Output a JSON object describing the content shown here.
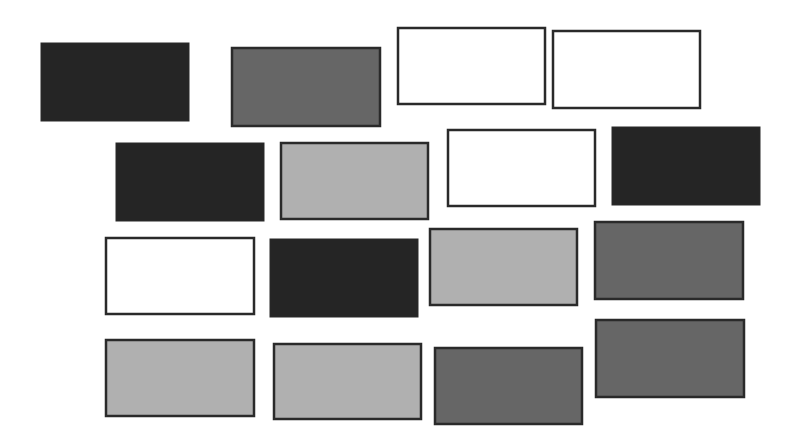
{
  "figure": {
    "shade_colors": {
      "black": "#252525",
      "dark_gray": "#666666",
      "light_gray": "#b0b0b0",
      "white": "#ffffff"
    },
    "border_color": "#2a2a2a",
    "rows": [
      [
        {
          "shade": "black",
          "x": 41,
          "y": 43,
          "w": 148,
          "h": 78
        },
        {
          "shade": "dark_gray",
          "x": 232,
          "y": 48,
          "w": 148,
          "h": 78
        },
        {
          "shade": "white",
          "x": 398,
          "y": 28,
          "w": 147,
          "h": 76
        },
        {
          "shade": "white",
          "x": 553,
          "y": 31,
          "w": 147,
          "h": 77
        }
      ],
      [
        {
          "shade": "black",
          "x": 116,
          "y": 143,
          "w": 148,
          "h": 78
        },
        {
          "shade": "light_gray",
          "x": 281,
          "y": 143,
          "w": 147,
          "h": 76
        },
        {
          "shade": "white",
          "x": 448,
          "y": 130,
          "w": 147,
          "h": 76
        },
        {
          "shade": "black",
          "x": 612,
          "y": 127,
          "w": 148,
          "h": 78
        }
      ],
      [
        {
          "shade": "white",
          "x": 106,
          "y": 238,
          "w": 148,
          "h": 76
        },
        {
          "shade": "black",
          "x": 270,
          "y": 239,
          "w": 148,
          "h": 78
        },
        {
          "shade": "light_gray",
          "x": 430,
          "y": 229,
          "w": 147,
          "h": 76
        },
        {
          "shade": "dark_gray",
          "x": 595,
          "y": 222,
          "w": 148,
          "h": 77
        }
      ],
      [
        {
          "shade": "light_gray",
          "x": 106,
          "y": 340,
          "w": 148,
          "h": 76
        },
        {
          "shade": "light_gray",
          "x": 274,
          "y": 344,
          "w": 147,
          "h": 75
        },
        {
          "shade": "dark_gray",
          "x": 435,
          "y": 348,
          "w": 147,
          "h": 76
        },
        {
          "shade": "dark_gray",
          "x": 596,
          "y": 320,
          "w": 148,
          "h": 77
        }
      ]
    ]
  }
}
